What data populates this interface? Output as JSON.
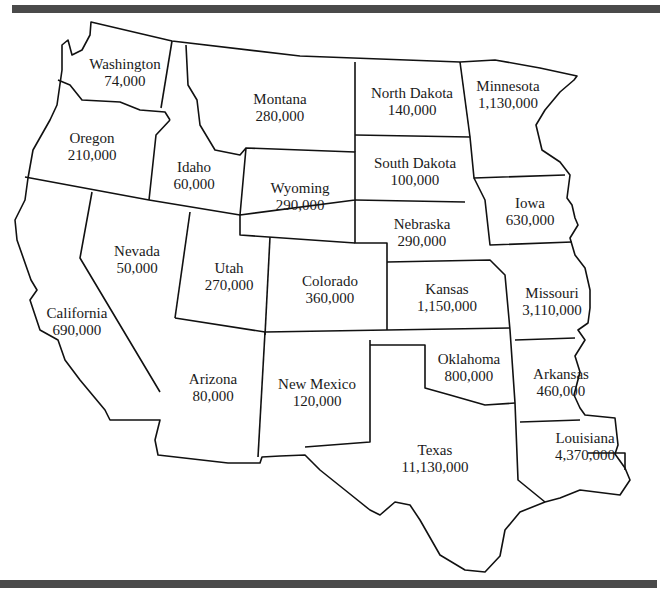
{
  "chart_data": {
    "type": "map",
    "region": "Western & Central United States",
    "states": [
      {
        "name": "Washington",
        "value": "74,000",
        "x": 125,
        "y": 73
      },
      {
        "name": "Oregon",
        "value": "210,000",
        "x": 92,
        "y": 147
      },
      {
        "name": "Idaho",
        "value": "60,000",
        "x": 194,
        "y": 176
      },
      {
        "name": "Montana",
        "value": "280,000",
        "x": 280,
        "y": 108
      },
      {
        "name": "North Dakota",
        "value": "140,000",
        "x": 412,
        "y": 102
      },
      {
        "name": "Minnesota",
        "value": "1,130,000",
        "x": 508,
        "y": 95
      },
      {
        "name": "South Dakota",
        "value": "100,000",
        "x": 415,
        "y": 172
      },
      {
        "name": "Wyoming",
        "value": "290,000",
        "x": 300,
        "y": 197
      },
      {
        "name": "Iowa",
        "value": "630,000",
        "x": 530,
        "y": 212
      },
      {
        "name": "Nevada",
        "value": "50,000",
        "x": 137,
        "y": 260
      },
      {
        "name": "Nebraska",
        "value": "290,000",
        "x": 422,
        "y": 233
      },
      {
        "name": "Utah",
        "value": "270,000",
        "x": 229,
        "y": 277
      },
      {
        "name": "Colorado",
        "value": "360,000",
        "x": 330,
        "y": 290
      },
      {
        "name": "Kansas",
        "value": "1,150,000",
        "x": 447,
        "y": 298
      },
      {
        "name": "Missouri",
        "value": "3,110,000",
        "x": 552,
        "y": 302
      },
      {
        "name": "California",
        "value": "690,000",
        "x": 77,
        "y": 322
      },
      {
        "name": "Oklahoma",
        "value": "800,000",
        "x": 469,
        "y": 368
      },
      {
        "name": "Arkansas",
        "value": "460,000",
        "x": 561,
        "y": 383
      },
      {
        "name": "Arizona",
        "value": "80,000",
        "x": 213,
        "y": 388
      },
      {
        "name": "New Mexico",
        "value": "120,000",
        "x": 317,
        "y": 393
      },
      {
        "name": "Louisiana",
        "value": "4,370,000",
        "x": 585,
        "y": 447
      },
      {
        "name": "Texas",
        "value": "11,130,000",
        "x": 435,
        "y": 459
      }
    ]
  }
}
